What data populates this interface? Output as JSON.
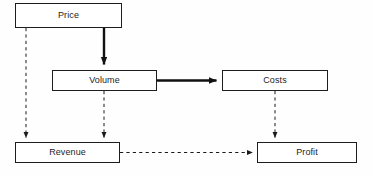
{
  "diagram": {
    "width": 373,
    "height": 175,
    "background_color": "#fefefe",
    "node_fill": "#ffffff",
    "node_stroke": "#1d1d1d",
    "label_color": "#242424",
    "solid_edge_color": "#111111",
    "dashed_edge_color": "#1a1a1a",
    "nodes": [
      {
        "id": "price",
        "label": "Price",
        "x": 15,
        "y": 3,
        "w": 107,
        "h": 25
      },
      {
        "id": "volume",
        "label": "Volume",
        "x": 52,
        "y": 70,
        "w": 105,
        "h": 21
      },
      {
        "id": "costs",
        "label": "Costs",
        "x": 222,
        "y": 70,
        "w": 106,
        "h": 21
      },
      {
        "id": "revenue",
        "label": "Revenue",
        "x": 15,
        "y": 142,
        "w": 105,
        "h": 21
      },
      {
        "id": "profit",
        "label": "Profit",
        "x": 257,
        "y": 142,
        "w": 100,
        "h": 21
      }
    ],
    "edges": [
      {
        "id": "price-to-volume",
        "from": "price",
        "to": "volume",
        "style": "solid",
        "weight": "thick",
        "orientation": "vertical"
      },
      {
        "id": "volume-to-costs",
        "from": "volume",
        "to": "costs",
        "style": "solid",
        "weight": "thick",
        "orientation": "horizontal"
      },
      {
        "id": "price-to-revenue",
        "from": "price",
        "to": "revenue",
        "style": "dashed",
        "weight": "thin",
        "orientation": "vertical"
      },
      {
        "id": "volume-to-revenue",
        "from": "volume",
        "to": "revenue",
        "style": "dashed",
        "weight": "thin",
        "orientation": "vertical"
      },
      {
        "id": "costs-to-profit",
        "from": "costs",
        "to": "profit",
        "style": "dashed",
        "weight": "thin",
        "orientation": "vertical"
      },
      {
        "id": "revenue-to-profit",
        "from": "revenue",
        "to": "profit",
        "style": "dashed",
        "weight": "thin",
        "orientation": "horizontal"
      }
    ]
  }
}
